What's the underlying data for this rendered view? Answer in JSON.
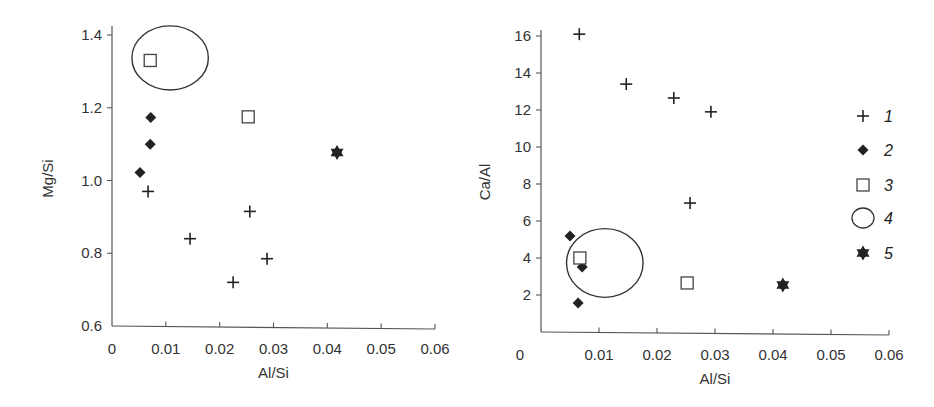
{
  "chart_data": [
    {
      "type": "scatter",
      "title": "",
      "xlabel": "Al/Si",
      "ylabel": "Mg/Si",
      "xlim": [
        0,
        0.06
      ],
      "ylim": [
        0.6,
        1.4
      ],
      "x_ticks": [
        "0",
        "0.01",
        "0.02",
        "0.03",
        "0.04",
        "0.05",
        "0.06"
      ],
      "y_ticks": [
        "0.6",
        "0.8",
        "1.0",
        "1.2",
        "1.4"
      ],
      "grid": false,
      "series": [
        {
          "name": "1",
          "marker": "plus",
          "points": [
            [
              0.0067,
              0.97
            ],
            [
              0.0145,
              0.84
            ],
            [
              0.0256,
              0.915
            ],
            [
              0.0288,
              0.785
            ],
            [
              0.0225,
              0.72
            ]
          ]
        },
        {
          "name": "2",
          "marker": "diamond",
          "points": [
            [
              0.0072,
              1.173
            ],
            [
              0.0071,
              1.1
            ],
            [
              0.0052,
              1.022
            ]
          ]
        },
        {
          "name": "3",
          "marker": "square",
          "points": [
            [
              0.0071,
              1.33
            ],
            [
              0.0253,
              1.175
            ]
          ]
        },
        {
          "name": "4",
          "marker": "ellipse",
          "ellipses": [
            {
              "cx": 0.0108,
              "cy": 1.337,
              "rx": 0.0071,
              "ry": 0.088
            }
          ]
        },
        {
          "name": "5",
          "marker": "star",
          "points": [
            [
              0.0418,
              1.077
            ]
          ]
        }
      ]
    },
    {
      "type": "scatter",
      "title": "",
      "xlabel": "Al/Si",
      "ylabel": "Ca/Al",
      "xlim": [
        0,
        0.06
      ],
      "ylim": [
        0,
        16
      ],
      "x_ticks": [
        "0",
        "0.01",
        "0.02",
        "0.03",
        "0.04",
        "0.05",
        "0.06"
      ],
      "y_ticks": [
        "2",
        "4",
        "6",
        "8",
        "10",
        "12",
        "14",
        "16"
      ],
      "grid": false,
      "legend_position": "right",
      "series": [
        {
          "name": "1",
          "marker": "plus",
          "points": [
            [
              0.0066,
              16.1
            ],
            [
              0.0147,
              13.4
            ],
            [
              0.0229,
              12.65
            ],
            [
              0.0293,
              11.9
            ],
            [
              0.0257,
              6.97
            ]
          ]
        },
        {
          "name": "2",
          "marker": "diamond",
          "points": [
            [
              0.005,
              5.19
            ],
            [
              0.0071,
              3.51
            ],
            [
              0.0064,
              1.57
            ]
          ]
        },
        {
          "name": "3",
          "marker": "square",
          "points": [
            [
              0.0067,
              4.0
            ],
            [
              0.0252,
              2.65
            ]
          ]
        },
        {
          "name": "4",
          "marker": "ellipse",
          "ellipses": [
            {
              "cx": 0.011,
              "cy": 3.73,
              "rx": 0.0066,
              "ry": 1.86
            }
          ]
        },
        {
          "name": "5",
          "marker": "star",
          "points": [
            [
              0.0417,
              2.54
            ]
          ]
        }
      ]
    }
  ],
  "legend": {
    "items": [
      {
        "marker": "plus",
        "label": "1"
      },
      {
        "marker": "diamond",
        "label": "2"
      },
      {
        "marker": "square",
        "label": "3"
      },
      {
        "marker": "ellipse",
        "label": "4"
      },
      {
        "marker": "star",
        "label": "5"
      }
    ]
  },
  "colors": {
    "ink": "#222222",
    "axis": "#555555"
  }
}
